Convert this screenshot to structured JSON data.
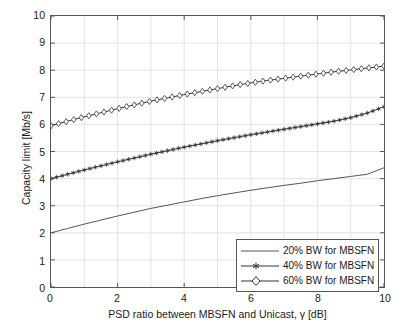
{
  "chart_data": {
    "type": "line",
    "title": "",
    "xlabel": "PSD ratio between MBSFN and Unicast, γ [dB]",
    "ylabel": "Capacity limit [Mb/s]",
    "xlim": [
      0,
      10
    ],
    "ylim": [
      0,
      10
    ],
    "xticks": [
      0,
      2,
      4,
      6,
      8,
      10
    ],
    "xticklabels": [
      "0",
      "2",
      "4",
      "6",
      "8",
      "10"
    ],
    "yticks": [
      0,
      1,
      2,
      3,
      4,
      5,
      6,
      7,
      8,
      9,
      10
    ],
    "yticklabels": [
      "0",
      "1",
      "2",
      "3",
      "4",
      "5",
      "6",
      "7",
      "8",
      "9",
      "10"
    ],
    "grid": true,
    "legend_position": "lower right",
    "x": [
      0,
      0.5,
      1,
      1.5,
      2,
      2.5,
      3,
      3.5,
      4,
      4.5,
      5,
      5.5,
      6,
      6.5,
      7,
      7.5,
      8,
      8.5,
      9,
      9.5,
      10
    ],
    "series": [
      {
        "name": "20% BW for MBSFN",
        "marker": "none",
        "color": "#555555",
        "values": [
          2.0,
          2.16,
          2.32,
          2.47,
          2.62,
          2.76,
          2.9,
          3.02,
          3.14,
          3.26,
          3.37,
          3.47,
          3.57,
          3.66,
          3.75,
          3.83,
          3.92,
          4.0,
          4.08,
          4.16,
          4.4
        ]
      },
      {
        "name": "40% BW for MBSFN",
        "marker": "star",
        "color": "#333333",
        "values": [
          4.0,
          4.16,
          4.32,
          4.47,
          4.62,
          4.76,
          4.9,
          5.03,
          5.16,
          5.28,
          5.4,
          5.51,
          5.62,
          5.72,
          5.82,
          5.92,
          6.02,
          6.12,
          6.25,
          6.42,
          6.65
        ]
      },
      {
        "name": "60% BW for MBSFN",
        "marker": "diamond",
        "color": "#333333",
        "values": [
          5.95,
          6.12,
          6.28,
          6.43,
          6.58,
          6.72,
          6.86,
          6.98,
          7.1,
          7.21,
          7.32,
          7.43,
          7.53,
          7.62,
          7.7,
          7.78,
          7.86,
          7.94,
          8.01,
          8.08,
          8.15
        ]
      }
    ]
  },
  "legend": {
    "entries": [
      "20% BW for MBSFN",
      "40% BW for MBSFN",
      "60% BW for MBSFN"
    ]
  },
  "colors": {
    "axis": "#555555",
    "grid": "#e4e4e4",
    "background": "#ffffff",
    "text": "#1a1a1a"
  }
}
